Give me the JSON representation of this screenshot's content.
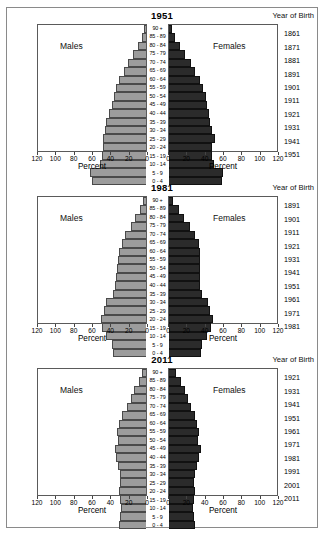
{
  "figure": {
    "yob_header": "Year of Birth",
    "males_label": "Males",
    "females_label": "Females",
    "x_axis_title": "Percent",
    "colors": {
      "male_bar": "#9c9c9c",
      "female_bar": "#2b2b2b",
      "frame": "#5a5a5a",
      "outer_frame": "#8a8a8a"
    },
    "age_groups": [
      "90 +",
      "85 - 89",
      "80 - 84",
      "75 - 79",
      "70 - 74",
      "65 - 69",
      "60 - 64",
      "55 - 59",
      "50 - 54",
      "45 - 49",
      "40 - 44",
      "35 - 39",
      "30 - 34",
      "25 - 29",
      "20 - 24",
      "15 - 19",
      "10 - 14",
      "5 - 9",
      "0 - 4"
    ],
    "x_ticks_left": [
      "120",
      "100",
      "80",
      "60",
      "40",
      "20",
      "0"
    ],
    "x_ticks_right": [
      "0",
      "20",
      "40",
      "60",
      "80",
      "100",
      "120"
    ]
  },
  "chart_data": [
    {
      "type": "bar",
      "title": "1951",
      "subtitle": "Year of Birth",
      "xlabel": "Percent",
      "ylabel": "",
      "xlim": [
        0,
        120
      ],
      "grid": false,
      "legend_position": "inside",
      "categories": [
        "90 +",
        "85 - 89",
        "80 - 84",
        "75 - 79",
        "70 - 74",
        "65 - 69",
        "60 - 64",
        "55 - 59",
        "50 - 54",
        "45 - 49",
        "40 - 44",
        "35 - 39",
        "30 - 34",
        "25 - 29",
        "20 - 24",
        "15 - 19",
        "10 - 14",
        "5 - 9",
        "0 - 4"
      ],
      "year_of_birth": [
        "1861",
        "1871",
        "1881",
        "1891",
        "1901",
        "1911",
        "1921",
        "1931",
        "1941",
        "1951"
      ],
      "series": [
        {
          "name": "Males",
          "values": [
            2,
            5,
            9,
            14,
            20,
            25,
            30,
            33,
            36,
            38,
            41,
            44,
            46,
            48,
            48,
            49,
            51,
            62,
            60
          ]
        },
        {
          "name": "Females",
          "values": [
            3,
            7,
            12,
            18,
            24,
            29,
            34,
            38,
            41,
            42,
            44,
            46,
            48,
            51,
            48,
            48,
            50,
            60,
            59
          ]
        }
      ]
    },
    {
      "type": "bar",
      "title": "1981",
      "subtitle": "Year of Birth",
      "xlabel": "Percent",
      "ylabel": "",
      "xlim": [
        0,
        120
      ],
      "grid": false,
      "legend_position": "inside",
      "categories": [
        "90 +",
        "85 - 89",
        "80 - 84",
        "75 - 79",
        "70 - 74",
        "65 - 69",
        "60 - 64",
        "55 - 59",
        "50 - 54",
        "45 - 49",
        "40 - 44",
        "35 - 39",
        "30 - 34",
        "25 - 29",
        "20 - 24",
        "15 - 19",
        "10 - 14",
        "5 - 9",
        "0 - 4"
      ],
      "year_of_birth": [
        "1891",
        "1901",
        "1911",
        "1921",
        "1931",
        "1941",
        "1951",
        "1961",
        "1971",
        "1981"
      ],
      "series": [
        {
          "name": "Males",
          "values": [
            3,
            7,
            12,
            17,
            23,
            27,
            30,
            31,
            32,
            33,
            34,
            37,
            44,
            47,
            50,
            49,
            44,
            38,
            37
          ]
        },
        {
          "name": "Females",
          "values": [
            5,
            11,
            17,
            23,
            29,
            33,
            34,
            34,
            34,
            34,
            34,
            37,
            43,
            46,
            49,
            47,
            42,
            37,
            36
          ]
        }
      ]
    },
    {
      "type": "bar",
      "title": "2011",
      "subtitle": "Year of Birth",
      "xlabel": "Percent",
      "ylabel": "",
      "xlim": [
        0,
        120
      ],
      "grid": false,
      "legend_position": "inside",
      "categories": [
        "90 +",
        "85 - 89",
        "80 - 84",
        "75 - 79",
        "70 - 74",
        "65 - 69",
        "60 - 64",
        "55 - 59",
        "50 - 54",
        "45 - 49",
        "40 - 44",
        "35 - 39",
        "30 - 34",
        "25 - 29",
        "20 - 24",
        "15 - 19",
        "10 - 14",
        "5 - 9",
        "0 - 4"
      ],
      "year_of_birth": [
        "1921",
        "1931",
        "1941",
        "1951",
        "1961",
        "1971",
        "1981",
        "1991",
        "2001",
        "2011"
      ],
      "series": [
        {
          "name": "Males",
          "values": [
            4,
            8,
            13,
            17,
            21,
            27,
            30,
            32,
            31,
            35,
            33,
            31,
            29,
            29,
            30,
            29,
            28,
            29,
            30
          ]
        },
        {
          "name": "Females",
          "values": [
            8,
            13,
            18,
            21,
            24,
            29,
            31,
            33,
            32,
            35,
            33,
            31,
            29,
            28,
            29,
            28,
            27,
            28,
            29
          ]
        }
      ]
    }
  ]
}
